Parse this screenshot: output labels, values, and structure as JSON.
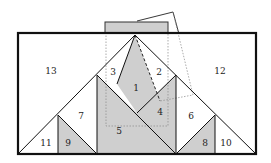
{
  "diagram": {
    "type": "tangram-style dissection",
    "colors": {
      "shaded": "#cfcfcf",
      "line": "#111111",
      "dotted": "#777777"
    },
    "pieces": [
      {
        "id": "1",
        "label": "1",
        "shaded": true
      },
      {
        "id": "2",
        "label": "2",
        "shaded": false
      },
      {
        "id": "3",
        "label": "3",
        "shaded": false
      },
      {
        "id": "4",
        "label": "4",
        "shaded": true
      },
      {
        "id": "5",
        "label": "5",
        "shaded": true
      },
      {
        "id": "6",
        "label": "6",
        "shaded": false
      },
      {
        "id": "7",
        "label": "7",
        "shaded": false
      },
      {
        "id": "8",
        "label": "8",
        "shaded": true
      },
      {
        "id": "9",
        "label": "9",
        "shaded": true
      },
      {
        "id": "10",
        "label": "10",
        "shaded": false
      },
      {
        "id": "11",
        "label": "11",
        "shaded": false
      },
      {
        "id": "12",
        "label": "12",
        "shaded": false
      },
      {
        "id": "13",
        "label": "13",
        "shaded": false
      }
    ]
  }
}
